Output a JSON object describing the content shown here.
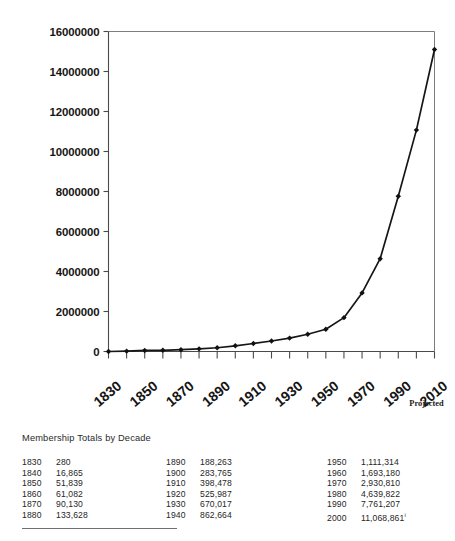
{
  "chart_data": {
    "type": "line",
    "title": "",
    "xlabel": "",
    "ylabel": "",
    "x": [
      1830,
      1840,
      1850,
      1860,
      1870,
      1880,
      1890,
      1900,
      1910,
      1920,
      1930,
      1940,
      1950,
      1960,
      1970,
      1980,
      1990,
      2000,
      2010
    ],
    "values": [
      280,
      16865,
      51839,
      61082,
      90130,
      133628,
      188263,
      283765,
      398478,
      525987,
      670017,
      862664,
      1111314,
      1693180,
      2930810,
      4639822,
      7761207,
      11068861,
      15100000
    ],
    "series": [
      {
        "name": "Membership",
        "values": [
          280,
          16865,
          51839,
          61082,
          90130,
          133628,
          188263,
          283765,
          398478,
          525987,
          670017,
          862664,
          1111314,
          1693180,
          2930810,
          4639822,
          7761207,
          11068861,
          15100000
        ]
      }
    ],
    "ylim": [
      0,
      16000000
    ],
    "xlim": [
      1830,
      2010
    ],
    "ytick_labels": [
      "0",
      "2000000",
      "4000000",
      "6000000",
      "8000000",
      "10000000",
      "12000000",
      "14000000",
      "16000000"
    ],
    "ytick_values": [
      0,
      2000000,
      4000000,
      6000000,
      8000000,
      10000000,
      12000000,
      14000000,
      16000000
    ],
    "xtick_labels": [
      "1830",
      "1850",
      "1870",
      "1890",
      "1910",
      "1930",
      "1950",
      "1970",
      "1990",
      "2010"
    ],
    "xtick_values": [
      1830,
      1850,
      1870,
      1890,
      1910,
      1930,
      1950,
      1970,
      1990,
      2010
    ],
    "minor_xticks": [
      1840,
      1860,
      1880,
      1900,
      1920,
      1940,
      1960,
      1980,
      2000
    ],
    "annotations": [
      {
        "text": "Projected",
        "x": 2010
      }
    ],
    "grid": false,
    "legend": "none",
    "marker": "diamond",
    "line_color": "#161616",
    "marker_color": "#111111"
  },
  "table": {
    "caption": "Membership Totals by Decade",
    "columns": [
      {
        "rows": [
          {
            "year": "1830",
            "value": "280"
          },
          {
            "year": "1840",
            "value": "16,865"
          },
          {
            "year": "1850",
            "value": "51,839"
          },
          {
            "year": "1860",
            "value": "61,082"
          },
          {
            "year": "1870",
            "value": "90,130"
          },
          {
            "year": "1880",
            "value": "133,628"
          }
        ]
      },
      {
        "rows": [
          {
            "year": "1890",
            "value": "188,263"
          },
          {
            "year": "1900",
            "value": "283,765"
          },
          {
            "year": "1910",
            "value": "398,478"
          },
          {
            "year": "1920",
            "value": "525,987"
          },
          {
            "year": "1930",
            "value": "670,017"
          },
          {
            "year": "1940",
            "value": "862,664"
          }
        ]
      },
      {
        "rows": [
          {
            "year": "1950",
            "value": "1,111,314"
          },
          {
            "year": "1960",
            "value": "1,693,180"
          },
          {
            "year": "1970",
            "value": "2,930,810"
          },
          {
            "year": "1980",
            "value": "4,639,822"
          },
          {
            "year": "1990",
            "value": "7,761,207"
          },
          {
            "year": "2000",
            "value": "11,068,861",
            "footnote": "i"
          }
        ]
      }
    ]
  }
}
